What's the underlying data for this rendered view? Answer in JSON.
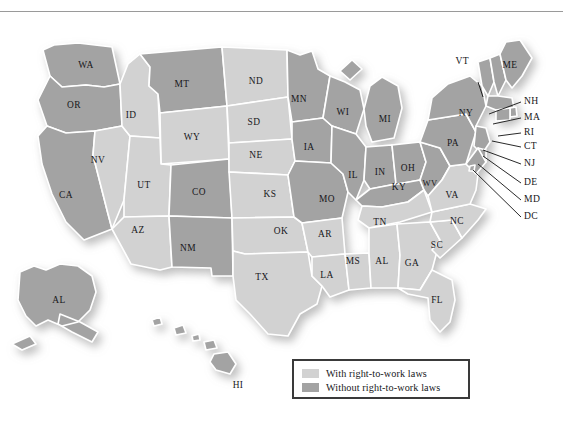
{
  "figure": {
    "title_ghost": "",
    "map_name": "United States right-to-work laws map"
  },
  "colors": {
    "with_rtw_fill": "#d2d2d2",
    "without_rtw_fill": "#a3a3a3",
    "state_border": "#ffffff",
    "map_outline": "#ffffff",
    "label_text": "#17171a",
    "legend_border": "#3a3a3a",
    "page_background": "#ffffff",
    "shadow": "#bfbfbf"
  },
  "legend": {
    "items": [
      {
        "label": "With right-to-work laws",
        "swatch": "#d2d2d2",
        "key": "with"
      },
      {
        "label": "Without right-to-work laws",
        "swatch": "#a3a3a3",
        "key": "without"
      }
    ]
  },
  "map": {
    "categories": [
      "with",
      "without"
    ],
    "states": [
      {
        "code": "WA",
        "category": "without",
        "x": 86,
        "y": 52
      },
      {
        "code": "OR",
        "category": "without",
        "x": 74,
        "y": 92
      },
      {
        "code": "CA",
        "category": "without",
        "x": 66,
        "y": 182
      },
      {
        "code": "NV",
        "category": "with",
        "x": 98,
        "y": 147
      },
      {
        "code": "ID",
        "category": "with",
        "x": 131,
        "y": 102
      },
      {
        "code": "MT",
        "category": "without",
        "x": 182,
        "y": 71
      },
      {
        "code": "WY",
        "category": "with",
        "x": 192,
        "y": 124
      },
      {
        "code": "UT",
        "category": "with",
        "x": 144,
        "y": 172
      },
      {
        "code": "AZ",
        "category": "with",
        "x": 138,
        "y": 217
      },
      {
        "code": "CO",
        "category": "without",
        "x": 199,
        "y": 179
      },
      {
        "code": "NM",
        "category": "without",
        "x": 188,
        "y": 235
      },
      {
        "code": "ND",
        "category": "with",
        "x": 256,
        "y": 68
      },
      {
        "code": "SD",
        "category": "with",
        "x": 254,
        "y": 109
      },
      {
        "code": "NE",
        "category": "with",
        "x": 256,
        "y": 142
      },
      {
        "code": "KS",
        "category": "with",
        "x": 270,
        "y": 181
      },
      {
        "code": "OK",
        "category": "with",
        "x": 281,
        "y": 218
      },
      {
        "code": "TX",
        "category": "with",
        "x": 262,
        "y": 264
      },
      {
        "code": "MN",
        "category": "without",
        "x": 299,
        "y": 86
      },
      {
        "code": "IA",
        "category": "without",
        "x": 309,
        "y": 134
      },
      {
        "code": "MO",
        "category": "without",
        "x": 327,
        "y": 186
      },
      {
        "code": "AR",
        "category": "with",
        "x": 325,
        "y": 221
      },
      {
        "code": "LA",
        "category": "with",
        "x": 327,
        "y": 262
      },
      {
        "code": "WI",
        "category": "without",
        "x": 343,
        "y": 99
      },
      {
        "code": "IL",
        "category": "without",
        "x": 353,
        "y": 162
      },
      {
        "code": "MS",
        "category": "with",
        "x": 353,
        "y": 248
      },
      {
        "code": "MI",
        "category": "without",
        "x": 385,
        "y": 106
      },
      {
        "code": "IN",
        "category": "without",
        "x": 380,
        "y": 159
      },
      {
        "code": "KY",
        "category": "without",
        "x": 399,
        "y": 174
      },
      {
        "code": "TN",
        "category": "with",
        "x": 380,
        "y": 209
      },
      {
        "code": "AL",
        "category": "with",
        "x": 382,
        "y": 248
      },
      {
        "code": "OH",
        "category": "without",
        "x": 408,
        "y": 155
      },
      {
        "code": "WV",
        "category": "without",
        "x": 430,
        "y": 170
      },
      {
        "code": "GA",
        "category": "with",
        "x": 412,
        "y": 250
      },
      {
        "code": "FL",
        "category": "with",
        "x": 437,
        "y": 287
      },
      {
        "code": "SC",
        "category": "with",
        "x": 437,
        "y": 232
      },
      {
        "code": "NC",
        "category": "with",
        "x": 457,
        "y": 208
      },
      {
        "code": "VA",
        "category": "with",
        "x": 452,
        "y": 182
      },
      {
        "code": "PA",
        "category": "without",
        "x": 453,
        "y": 130
      },
      {
        "code": "NY",
        "category": "without",
        "x": 466,
        "y": 100
      },
      {
        "code": "ME",
        "category": "without",
        "x": 510,
        "y": 65
      },
      {
        "code": "VT",
        "category": "without",
        "x": 478,
        "y": 60
      },
      {
        "code": "AL",
        "category": "without",
        "x": 59,
        "y": 287,
        "note": "Alaska inset label as printed"
      },
      {
        "code": "HI",
        "category": "without",
        "x": 238,
        "y": 372
      }
    ],
    "callouts": [
      {
        "code": "VT",
        "label_x": 472,
        "label_y": 60,
        "line": "478,68 483,83"
      },
      {
        "code": "NH",
        "label_x": 524,
        "label_y": 88,
        "line": "521,88 489,100"
      },
      {
        "code": "MA",
        "label_x": 524,
        "label_y": 104,
        "line": "521,104 493,110"
      },
      {
        "code": "RI",
        "label_x": 524,
        "label_y": 119,
        "line": "521,119 496,122"
      },
      {
        "code": "CT",
        "label_x": 524,
        "label_y": 133,
        "line": "521,133 490,127"
      },
      {
        "code": "NJ",
        "label_x": 524,
        "label_y": 150,
        "line": "521,150 481,138"
      },
      {
        "code": "DE",
        "label_x": 524,
        "label_y": 169,
        "line": "521,169 479,152"
      },
      {
        "code": "MD",
        "label_x": 524,
        "label_y": 186,
        "line": "521,186 474,155"
      },
      {
        "code": "DC",
        "label_x": 524,
        "label_y": 203,
        "line": "521,203 472,160"
      }
    ]
  }
}
